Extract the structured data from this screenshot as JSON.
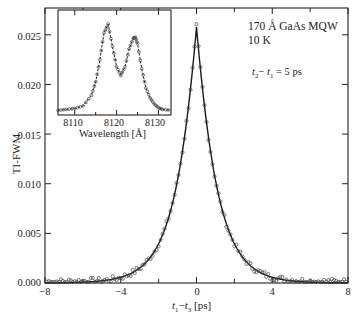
{
  "chart_data": [
    {
      "type": "line",
      "role": "main",
      "title": "",
      "xlabel": "t1 − t3 [ps]",
      "ylabel": "TI-FWM",
      "xlim": [
        -8,
        8
      ],
      "ylim": [
        0.0,
        0.027
      ],
      "xticks": [
        -8,
        -4,
        0,
        4,
        8
      ],
      "xtick_labels": [
        "−8",
        "−4",
        "0",
        "4",
        "8"
      ],
      "yticks": [
        0.0,
        0.005,
        0.01,
        0.015,
        0.02,
        0.025
      ],
      "ytick_labels": [
        "0.000",
        "0.005",
        "0.010",
        "0.015",
        "0.020",
        "0.025"
      ],
      "grid": false,
      "annotations": [
        "170 Å GaAs MQW",
        "10 K",
        "t2 − t1 = 5 ps"
      ],
      "series": [
        {
          "name": "experiment (open circles)",
          "style": "markers",
          "x": [
            -8,
            -7,
            -6,
            -5,
            -4.5,
            -4,
            -3.5,
            -3,
            -2.5,
            -2,
            -1.5,
            -1,
            -0.75,
            -0.5,
            -0.25,
            0,
            0.25,
            0.5,
            0.75,
            1,
            1.5,
            2,
            2.5,
            3,
            3.5,
            4,
            4.5,
            5,
            6,
            7,
            8
          ],
          "y": [
            0.0003,
            0.0003,
            0.0004,
            0.0005,
            0.0007,
            0.0009,
            0.0014,
            0.0022,
            0.0033,
            0.005,
            0.0075,
            0.0115,
            0.0145,
            0.0182,
            0.0225,
            0.026,
            0.0225,
            0.0182,
            0.0145,
            0.0115,
            0.0075,
            0.005,
            0.0033,
            0.0024,
            0.0016,
            0.0011,
            0.0008,
            0.0006,
            0.0004,
            0.0003,
            0.0003
          ]
        },
        {
          "name": "fit (solid line)",
          "style": "line",
          "x": [
            -8,
            -6,
            -4,
            -3,
            -2,
            -1.5,
            -1,
            -0.5,
            0,
            0.5,
            1,
            1.5,
            2,
            3,
            4,
            6,
            8
          ],
          "y": [
            0.0001,
            0.0003,
            0.0009,
            0.0021,
            0.0049,
            0.0074,
            0.0113,
            0.018,
            0.0258,
            0.018,
            0.0113,
            0.0074,
            0.0049,
            0.0021,
            0.0009,
            0.0003,
            0.0001
          ]
        }
      ]
    },
    {
      "type": "line",
      "role": "inset",
      "xlabel": "Wavelength [Å]",
      "ylabel": "",
      "xlim": [
        8106,
        8133
      ],
      "xticks": [
        8110,
        8120,
        8130
      ],
      "xtick_labels": [
        "8110",
        "8120",
        "8130"
      ],
      "series": [
        {
          "name": "spectrum (circles, dashed)",
          "style": "dashed+markers",
          "x": [
            8106,
            8108,
            8110,
            8112,
            8114,
            8115,
            8116,
            8117,
            8118,
            8119,
            8120,
            8121,
            8122,
            8123,
            8124,
            8124.5,
            8125,
            8126,
            8127,
            8128,
            8129,
            8130,
            8131,
            8133
          ],
          "y": [
            0.03,
            0.04,
            0.05,
            0.08,
            0.2,
            0.35,
            0.6,
            0.9,
            1.0,
            0.75,
            0.52,
            0.42,
            0.52,
            0.72,
            0.84,
            0.85,
            0.78,
            0.5,
            0.28,
            0.17,
            0.1,
            0.06,
            0.04,
            0.03
          ]
        }
      ]
    }
  ],
  "labels": {
    "ylabel": "TI-FWM",
    "xlabel_t_a": "t",
    "xlabel_sub_a": "1",
    "xlabel_dash": "−",
    "xlabel_t_b": "t",
    "xlabel_sub_b": "3",
    "xlabel_unit": " [ps]",
    "sample": "170 Å GaAs MQW",
    "temperature": "10 K",
    "delay_t_a": "t",
    "delay_sub_a": "2",
    "delay_dash": "− ",
    "delay_t_b": "t",
    "delay_sub_b": "1",
    "delay_value": " = 5 ps",
    "inset_xlabel": "Wavelength [Å]"
  },
  "ticks": {
    "y": [
      "0.025",
      "0.020",
      "0.015",
      "0.010",
      "0.005",
      "0.000"
    ],
    "x": [
      "−8",
      "−4",
      "0",
      "4",
      "8"
    ],
    "inset_x": [
      "8110",
      "8120",
      "8130"
    ]
  },
  "colors": {
    "axis": "#222222",
    "line": "#1a1a1a",
    "marker": "#444444",
    "background": "#ffffff"
  }
}
